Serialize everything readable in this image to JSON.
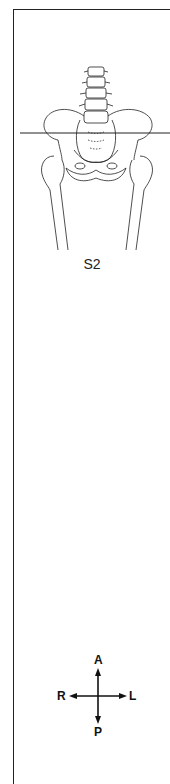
{
  "figure": {
    "slice_label": "S2",
    "illustration": "anterior view of lumbar spine, pelvis and proximal femurs with horizontal axial slice line at S2 level",
    "colors": {
      "line": "#222222",
      "background": "#ffffff"
    }
  },
  "orientation": {
    "anterior": "A",
    "posterior": "P",
    "right": "R",
    "left": "L"
  }
}
